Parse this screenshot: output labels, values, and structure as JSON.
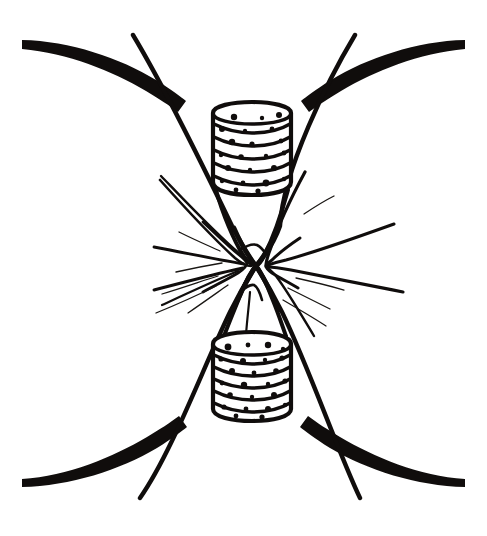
{
  "figure": {
    "title": "Mitotic spindle apparatus with paired centrioles",
    "caption": "",
    "style": "black ink line drawing on white background",
    "background_color": "#ffffff",
    "ink_color": "#100d0c",
    "canvas": {
      "width": 487,
      "height": 536
    }
  },
  "labels": {
    "none_visible": ""
  },
  "structures": {
    "centriole_top": {
      "name": "top-centriole-cylinder",
      "description": "vertical banded cylinder, upper pole",
      "box": {
        "x": 211,
        "y": 104,
        "width": 80,
        "height": 88
      },
      "band_count": 6,
      "dot_count": 24
    },
    "centriole_bottom": {
      "name": "bottom-centriole-cylinder",
      "description": "vertical banded cylinder, lower pole",
      "box": {
        "x": 211,
        "y": 333,
        "width": 80,
        "height": 84
      },
      "band_count": 6,
      "dot_count": 25
    },
    "spindle": {
      "name": "spindle-fiber-x-crossing",
      "crossing_point": {
        "x": 256,
        "y": 266
      },
      "upper_cone_apex": {
        "x": 256,
        "y": 266
      },
      "lower_cone_apex": {
        "x": 256,
        "y": 266
      }
    },
    "membrane_arcs": {
      "name": "cell-membrane-arcs",
      "count": 4,
      "corners": [
        "top-left",
        "top-right",
        "bottom-left",
        "bottom-right"
      ]
    },
    "astral_fibers": {
      "name": "astral-fiber-rays",
      "thick_ray_count": 8,
      "thin_ray_count": 9
    },
    "pole_fibers": {
      "name": "polar-fiber-lines",
      "count": 4,
      "description": "long straight lines from each corner converging at the crossing"
    }
  }
}
